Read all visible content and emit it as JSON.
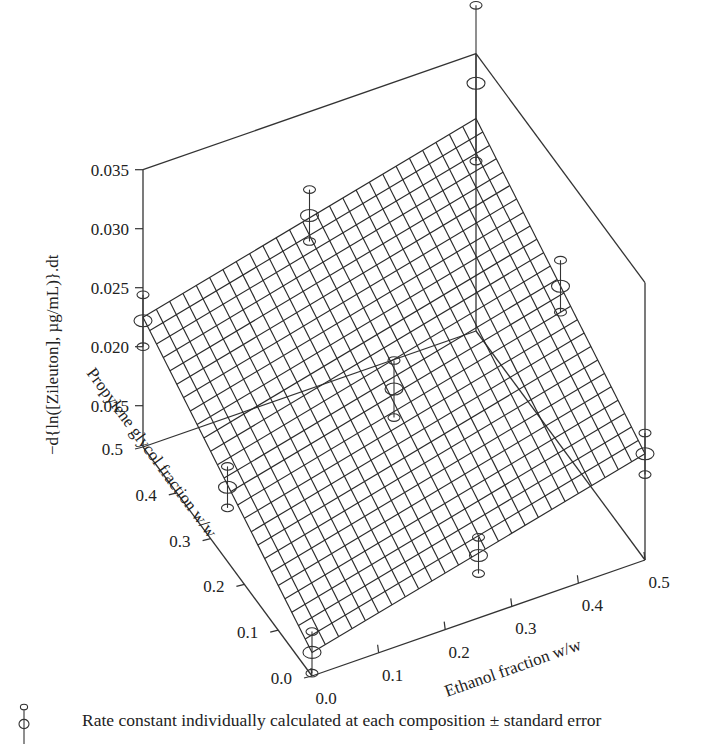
{
  "chart_data": {
    "type": "surface3d",
    "title": "",
    "xlabel": "Ethanol fraction w/w",
    "ylabel": "Propylene glycol fraction w/w",
    "zlabel": "−d{ln([Zileuton], µg/mL)}.dt",
    "x_ticks": [
      "0.0",
      "0.1",
      "0.2",
      "0.3",
      "0.4",
      "0.5"
    ],
    "y_ticks": [
      "0.0",
      "0.1",
      "0.2",
      "0.3",
      "0.4",
      "0.5"
    ],
    "z_ticks": [
      "0.015",
      "0.020",
      "0.025",
      "0.030",
      "0.035"
    ],
    "xlim": [
      0.0,
      0.5
    ],
    "ylim": [
      0.0,
      0.5
    ],
    "zlim": [
      0.0115,
      0.035
    ],
    "surface": {
      "description": "Fitted linear plane (mesh) of rate constant vs ethanol and propylene glycol fractions",
      "corners": [
        {
          "ethanol": 0.0,
          "propylene_glycol": 0.0,
          "rate": 0.0135
        },
        {
          "ethanol": 0.5,
          "propylene_glycol": 0.0,
          "rate": 0.0205
        },
        {
          "ethanol": 0.0,
          "propylene_glycol": 0.5,
          "rate": 0.0225
        },
        {
          "ethanol": 0.5,
          "propylene_glycol": 0.5,
          "rate": 0.0295
        }
      ],
      "grid_divisions": 25
    },
    "series": [
      {
        "name": "Rate constant individually calculated at each composition ± standard error",
        "points": [
          {
            "ethanol": 0.0,
            "propylene_glycol": 0.0,
            "rate": 0.0135,
            "se": 0.0008
          },
          {
            "ethanol": 0.25,
            "propylene_glycol": 0.0,
            "rate": 0.0168,
            "se": 0.0007
          },
          {
            "ethanol": 0.5,
            "propylene_glycol": 0.0,
            "rate": 0.0205,
            "se": 0.0008
          },
          {
            "ethanol": 0.0,
            "propylene_glycol": 0.25,
            "rate": 0.0178,
            "se": 0.0008
          },
          {
            "ethanol": 0.25,
            "propylene_glycol": 0.25,
            "rate": 0.0212,
            "se": 0.0011
          },
          {
            "ethanol": 0.5,
            "propylene_glycol": 0.25,
            "rate": 0.025,
            "se": 0.001
          },
          {
            "ethanol": 0.0,
            "propylene_glycol": 0.5,
            "rate": 0.0222,
            "se": 0.001
          },
          {
            "ethanol": 0.25,
            "propylene_glycol": 0.5,
            "rate": 0.0262,
            "se": 0.001
          },
          {
            "ethanol": 0.5,
            "propylene_glycol": 0.5,
            "rate": 0.0325,
            "se": 0.003
          }
        ]
      }
    ],
    "legend": {
      "position": "bottom-left",
      "entries": [
        "Rate constant individually calculated at each composition ± standard error"
      ]
    },
    "grid": false
  },
  "projection": {
    "origin": [
      312,
      676
    ],
    "ethanol_end": [
      645,
      560
    ],
    "pg_end": [
      143,
      447
    ],
    "z_pixel_per_unit": 11800,
    "z_base": 0.0115
  },
  "legend": {
    "icon": "errorbar-icon",
    "text": "Rate constant individually calculated at each composition ± standard error"
  }
}
